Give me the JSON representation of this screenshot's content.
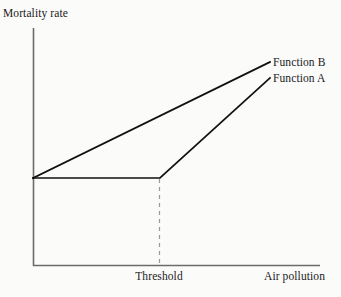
{
  "chart_data": {
    "type": "line",
    "title": "",
    "subtitle": "",
    "xlabel": "Air pollution",
    "ylabel": "Mortality rate",
    "grid": false,
    "legend_position": "inline-right-of-line-ends",
    "xlim": [
      0,
      1
    ],
    "ylim": [
      0,
      1
    ],
    "xticks": [],
    "yticks": [],
    "xtick_labels": [],
    "ytick_labels": [],
    "annotations": [
      {
        "name": "threshold-marker",
        "label": "Threshold",
        "x": 0.44,
        "style": "dashed-vertical-line",
        "from_y": 0.37,
        "to_y": 0.0
      }
    ],
    "series": [
      {
        "name": "Function B",
        "label": "Function B",
        "color": "#111111",
        "style": "solid",
        "description": "No-threshold linear relationship: mortality rises from the baseline immediately as air pollution increases.",
        "x": [
          0.0,
          1.0
        ],
        "y": [
          0.37,
          0.86
        ],
        "points_px": [
          [
            33,
            178
          ],
          [
            270,
            62
          ]
        ]
      },
      {
        "name": "Function A",
        "label": "Function A",
        "color": "#111111",
        "style": "solid",
        "description": "Threshold relationship: mortality stays flat at the baseline until the threshold, then rises linearly.",
        "x": [
          0.0,
          0.44,
          1.0
        ],
        "y": [
          0.37,
          0.37,
          0.79
        ],
        "points_px": [
          [
            33,
            178
          ],
          [
            160,
            178
          ],
          [
            270,
            78
          ]
        ]
      }
    ]
  },
  "labels": {
    "ylabel": "Mortality rate",
    "xlabel": "Air pollution",
    "threshold": "Threshold",
    "function_b": "Function B",
    "function_a": "Function A"
  },
  "colors": {
    "background": "#fbfbfa",
    "axis": "#5a5a5a",
    "line": "#111111",
    "dashed": "#8a8a8a",
    "text": "#1a1a1a"
  }
}
